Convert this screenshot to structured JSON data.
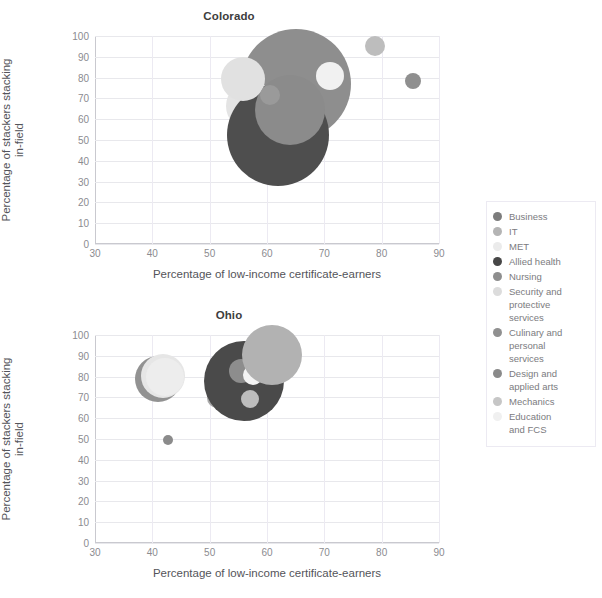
{
  "figure": {
    "xlabel": "Percentage of low-income certificate-earners",
    "ylabel_line1": "Percentage of stackers stacking",
    "ylabel_line2": "in-field"
  },
  "legend": {
    "items": [
      {
        "label": "Business",
        "color": "#7c7c7c"
      },
      {
        "label": "IT",
        "color": "#b4b4b4"
      },
      {
        "label": "MET",
        "color": "#ebebeb"
      },
      {
        "label": "Allied health",
        "color": "#474747"
      },
      {
        "label": "Nursing",
        "color": "#8e8e8e"
      },
      {
        "label": "Security and\nprotective\nservices",
        "color": "#dcdcdc"
      },
      {
        "label": "Culinary and\npersonal\nservices",
        "color": "#909090"
      },
      {
        "label": "Design and\napplied arts",
        "color": "#8a8a8a"
      },
      {
        "label": "Mechanics",
        "color": "#c6c6c6"
      },
      {
        "label": "Education\nand FCS",
        "color": "#f0f0f0"
      }
    ]
  },
  "chart_data": [
    {
      "type": "scatter",
      "title": "Colorado",
      "xlabel": "Percentage of low-income certificate-earners",
      "ylabel": "Percentage of stackers stacking in-field",
      "xlim": [
        30,
        90
      ],
      "ylim": [
        0,
        100
      ],
      "xticks": [
        30,
        40,
        50,
        60,
        70,
        80,
        90
      ],
      "yticks": [
        0,
        10,
        20,
        30,
        40,
        50,
        60,
        70,
        80,
        90,
        100
      ],
      "grid": true,
      "legend_position": "right-outside",
      "points": [
        {
          "name": "Business",
          "x": 65.0,
          "y": 77.0,
          "size": 55,
          "color": "#8e8e8e"
        },
        {
          "name": "IT",
          "x": 56.8,
          "y": 73.0,
          "size": 16,
          "color": "#a9a9a9"
        },
        {
          "name": "MET",
          "x": 57.2,
          "y": 66.5,
          "size": 25,
          "color": "#e4e4e4"
        },
        {
          "name": "Allied health",
          "x": 62.0,
          "y": 52.5,
          "size": 51,
          "color": "#4e4e4e"
        },
        {
          "name": "Nursing",
          "x": 64.0,
          "y": 64.5,
          "size": 35,
          "color": "#8b8b8b"
        },
        {
          "name": "Security and protective services",
          "x": 55.8,
          "y": 79.5,
          "size": 22,
          "color": "#e1e1e1"
        },
        {
          "name": "Culinary and personal services",
          "x": 85.5,
          "y": 78.5,
          "size": 8,
          "color": "#8f8f8f"
        },
        {
          "name": "Design and applied arts",
          "x": 60.5,
          "y": 71.5,
          "size": 10,
          "color": "#9a9a9a"
        },
        {
          "name": "Mechanics",
          "x": 78.8,
          "y": 95.0,
          "size": 10,
          "color": "#bdbdbd"
        },
        {
          "name": "Education and FCS",
          "x": 71.0,
          "y": 81.0,
          "size": 14,
          "color": "#f1f1f1"
        }
      ]
    },
    {
      "type": "scatter",
      "title": "Ohio",
      "xlabel": "Percentage of low-income certificate-earners",
      "ylabel": "Percentage of stackers stacking in-field",
      "xlim": [
        30,
        90
      ],
      "ylim": [
        0,
        100
      ],
      "xticks": [
        30,
        40,
        50,
        60,
        70,
        80,
        90
      ],
      "yticks": [
        0,
        10,
        20,
        30,
        40,
        50,
        60,
        70,
        80,
        90,
        100
      ],
      "grid": true,
      "legend_position": "right-outside",
      "points": [
        {
          "name": "Business",
          "x": 41.0,
          "y": 79.0,
          "size": 23,
          "color": "#929292"
        },
        {
          "name": "IT",
          "x": 51.2,
          "y": 69.5,
          "size": 10,
          "color": "#a8a8a8"
        },
        {
          "name": "MET",
          "x": 41.8,
          "y": 80.5,
          "size": 22,
          "color": "#e6e6e6"
        },
        {
          "name": "Allied health",
          "x": 56.0,
          "y": 78.0,
          "size": 40,
          "color": "#4a4a4a"
        },
        {
          "name": "Nursing",
          "x": 55.5,
          "y": 82.5,
          "size": 12,
          "color": "#8d8d8d"
        },
        {
          "name": "Security and protective services",
          "x": 57.5,
          "y": 81.0,
          "size": 10,
          "color": "#f4f4f4"
        },
        {
          "name": "Culinary and personal services",
          "x": 42.7,
          "y": 49.5,
          "size": 5,
          "color": "#8b8b8b"
        },
        {
          "name": "Design and applied arts",
          "x": 57.0,
          "y": 69.0,
          "size": 9,
          "color": "#bdbdbd"
        },
        {
          "name": "Mechanics",
          "x": 60.8,
          "y": 90.5,
          "size": 30,
          "color": "#b2b2b2"
        },
        {
          "name": "Education and FCS",
          "x": 42.2,
          "y": 80.0,
          "size": 19,
          "color": "#ededed"
        }
      ]
    }
  ]
}
